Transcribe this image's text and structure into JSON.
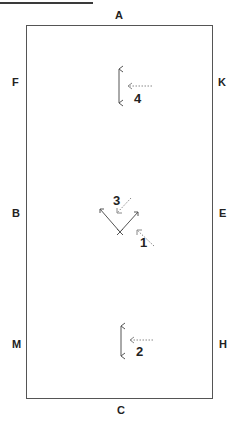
{
  "diagram": {
    "title_underline": true,
    "arena_markers": {
      "top": "A",
      "bottom": "C",
      "left_upper": "F",
      "left_middle": "B",
      "left_lower": "M",
      "right_upper": "K",
      "right_middle": "E",
      "right_lower": "H"
    },
    "movements": [
      {
        "step": "1",
        "description": "dotted approach arrow from lower right toward the center V"
      },
      {
        "step": "2",
        "description": "dotted arrow pointing left to a vertical bracket near C"
      },
      {
        "step": "3",
        "description": "dotted arrow pointing down-left into the center V"
      },
      {
        "step": "4",
        "description": "dotted arrow pointing left to a vertical bracket near A"
      }
    ],
    "colors": {
      "line": "#555555",
      "text": "#222222",
      "arrow": "#888888"
    }
  }
}
